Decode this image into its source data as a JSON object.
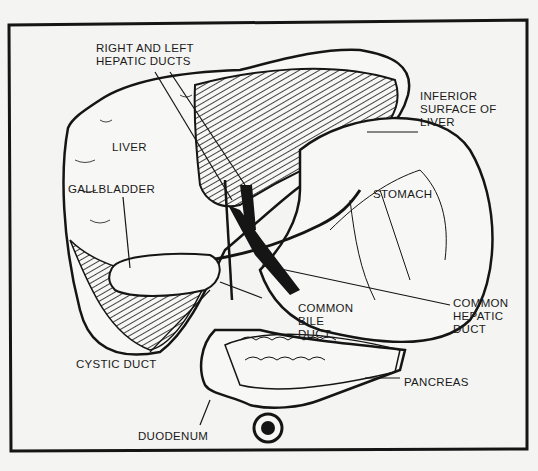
{
  "diagram": {
    "colors": {
      "ink": "#151515",
      "paper": "#f4f4f2"
    },
    "labels": {
      "hepatic_ducts": [
        "RIGHT AND LEFT",
        "HEPATIC DUCTS"
      ],
      "inferior_surface": [
        "INFERIOR",
        "SURFACE OF",
        "LIVER"
      ],
      "liver": "LIVER",
      "gallbladder": "GALLBLADDER",
      "stomach": "STOMACH",
      "common_bile_duct": [
        "COMMON",
        "BILE",
        "DUCT"
      ],
      "common_hepatic_duct": [
        "COMMON",
        "HEPATIC",
        "DUCT"
      ],
      "cystic_duct": "CYSTIC DUCT",
      "pancreas": "PANCREAS",
      "duodenum": "DUODENUM"
    }
  }
}
